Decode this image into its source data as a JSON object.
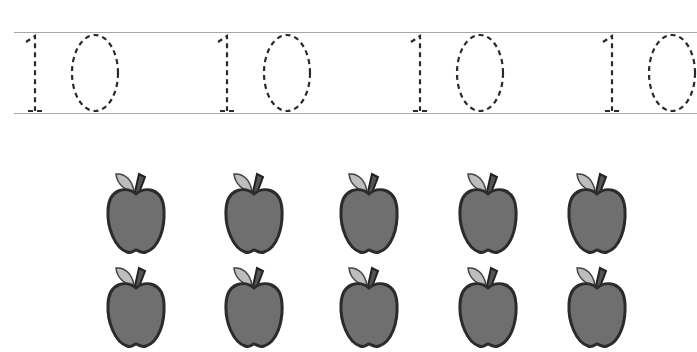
{
  "worksheet": {
    "tracing_row": {
      "number_text": "10",
      "repetitions": 4,
      "positions_x": [
        22,
        214,
        407,
        599
      ],
      "style": "dashed-outline"
    },
    "counting": {
      "object": "apple",
      "rows_visible": 2,
      "per_row": 5,
      "total_apples": 10,
      "columns_x": [
        105,
        223,
        338,
        457,
        566
      ],
      "rows_y": [
        170,
        264
      ]
    },
    "colors": {
      "guide_line": "#a8a8a8",
      "dash": "#2a2a2a",
      "apple_fill": "#6f6f6f",
      "apple_outline": "#2b2b2b",
      "leaf_fill": "#bdbdbd"
    }
  }
}
